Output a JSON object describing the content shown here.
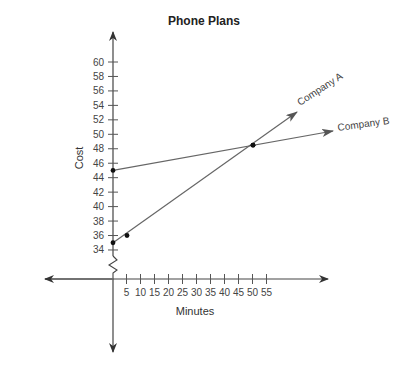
{
  "chart_data": {
    "type": "line",
    "title": "Phone Plans",
    "xlabel": "Minutes",
    "ylabel": "Cost",
    "x_ticks": [
      5,
      10,
      15,
      20,
      25,
      30,
      35,
      40,
      45,
      50,
      55
    ],
    "y_ticks": [
      34,
      36,
      38,
      40,
      42,
      44,
      46,
      48,
      50,
      52,
      54,
      56,
      58,
      60
    ],
    "xlim": [
      0,
      55
    ],
    "ylim": [
      34,
      60
    ],
    "y_axis_break": true,
    "grid": false,
    "series": [
      {
        "name": "Company A",
        "points": [
          [
            0,
            35
          ],
          [
            5,
            36
          ],
          [
            50,
            48.5
          ]
        ],
        "marked_points": [
          [
            0,
            35
          ],
          [
            5,
            36
          ],
          [
            50,
            48.5
          ]
        ]
      },
      {
        "name": "Company B",
        "points": [
          [
            0,
            45
          ],
          [
            50,
            48.5
          ]
        ],
        "marked_points": [
          [
            0,
            45
          ],
          [
            50,
            48.5
          ]
        ]
      }
    ],
    "intersection": {
      "x": 50,
      "y": 48.5
    },
    "legend": "inline labels at line ends"
  }
}
